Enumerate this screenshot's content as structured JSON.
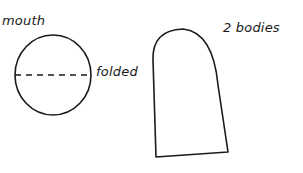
{
  "diagram": {
    "stroke_color": "#1a1a1a",
    "background": "#ffffff",
    "pieces": [
      {
        "id": "mouth",
        "shape": "circle",
        "label": "mouth",
        "fold_line_label": "folded"
      },
      {
        "id": "bodies",
        "shape": "arch",
        "label": "2 bodies"
      }
    ]
  }
}
